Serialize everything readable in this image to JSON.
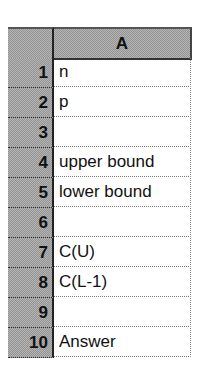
{
  "sheet": {
    "columns": [
      {
        "label": "A"
      }
    ],
    "rows": [
      {
        "number": "1",
        "A": "n"
      },
      {
        "number": "2",
        "A": "p"
      },
      {
        "number": "3",
        "A": ""
      },
      {
        "number": "4",
        "A": "upper bound"
      },
      {
        "number": "5",
        "A": "lower bound"
      },
      {
        "number": "6",
        "A": ""
      },
      {
        "number": "7",
        "A": "C(U)"
      },
      {
        "number": "8",
        "A": "C(L-1)"
      },
      {
        "number": "9",
        "A": ""
      },
      {
        "number": "10",
        "A": "Answer"
      }
    ]
  },
  "colors": {
    "header_background": "#b4b4b4",
    "cell_background": "#ffffff",
    "text": "#111111"
  }
}
